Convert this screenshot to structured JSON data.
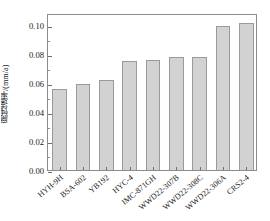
{
  "chart_data": {
    "type": "bar",
    "title": "",
    "xlabel": "",
    "ylabel": "腐蚀速率/(mm/a)",
    "categories": [
      "HYH-9H",
      "BSA-602",
      "YB192",
      "HYC-4",
      "IMC-871GH",
      "WWD22-307B",
      "WWD22-308C",
      "WWD22-306A",
      "CRS2-4"
    ],
    "values": [
      0.056,
      0.059,
      0.062,
      0.075,
      0.0755,
      0.0775,
      0.078,
      0.099,
      0.101
    ],
    "ylim": [
      0.0,
      0.108
    ],
    "yticks": [
      0.0,
      0.02,
      0.04,
      0.06,
      0.08,
      0.1
    ],
    "ytick_labels": [
      "0.00",
      "0.02",
      "0.04",
      "0.06",
      "0.08",
      "0.10"
    ],
    "minor_yticks": [
      0.01,
      0.03,
      0.05,
      0.07,
      0.09
    ],
    "grid": false,
    "legend": null,
    "bar_fill_color": "#d2d2d2",
    "bar_edge_color": "#9a9a9a",
    "axis_color": "#8c8c8c",
    "background_color": "#ffffff"
  }
}
